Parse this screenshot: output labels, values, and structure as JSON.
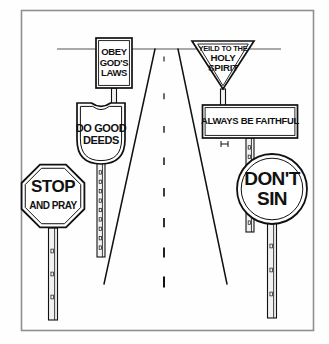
{
  "illustration": {
    "title": "Road with religious traffic signs",
    "background_color": "#fefefe",
    "ink_color": "#111111",
    "frame_color": "#8f8f8f",
    "frame": {
      "x": 21,
      "y": 10,
      "width": 292,
      "height": 320
    },
    "horizon": {
      "y": 49,
      "x_start": 57,
      "x_end": 281
    },
    "road": {
      "vanishing_x": 164,
      "top_y": 49,
      "left_top_x": 155,
      "right_top_x": 178,
      "left_bottom_x": 104,
      "right_bottom_x": 227,
      "bottom_y": 284,
      "center_dash_count": 8
    },
    "signs": [
      {
        "name": "obey-gods-laws-sign",
        "shape": "rectangle-vertical",
        "lines": [
          "OBEY",
          "GOD'S",
          "LAWS"
        ],
        "center_x": 114,
        "top_y": 38,
        "width": 36,
        "height": 50,
        "font_size": 9.5
      },
      {
        "name": "do-good-deeds-sign",
        "shape": "shield",
        "lines": [
          "DO GOOD",
          "DEEDS"
        ],
        "center_x": 101,
        "top_y": 103,
        "width": 48,
        "height": 61,
        "font_size": 11
      },
      {
        "name": "stop-and-pray-sign",
        "shape": "octagon",
        "lines": [
          "STOP",
          "AND PRAY"
        ],
        "center_x": 53,
        "center_y": 196,
        "radius": 34,
        "font_size": 17,
        "font_size_secondary": 10
      },
      {
        "name": "yeild-to-the-holy-spirit-sign",
        "shape": "triangle-down",
        "lines": [
          "YEILD TO THE",
          "HOLY",
          "SPIRIT"
        ],
        "center_x": 223,
        "top_y": 41,
        "width": 62,
        "height": 48,
        "font_size": 7.5
      },
      {
        "name": "always-be-faithful-sign",
        "shape": "rectangle-horizontal",
        "lines": [
          "ALWAYS BE FAITHFUL"
        ],
        "center_x": 250,
        "top_y": 105,
        "width": 95,
        "height": 33,
        "font_size": 9.5
      },
      {
        "name": "dont-sin-sign",
        "shape": "circle",
        "lines": [
          "DON'T",
          "SIN"
        ],
        "center_x": 272,
        "center_y": 189,
        "radius": 35,
        "font_size": 19
      }
    ],
    "posts": [
      {
        "name": "post-stop-and-pray",
        "x": 53,
        "top_y": 228,
        "bottom_y": 320,
        "width": 9,
        "holes": 3
      },
      {
        "name": "post-do-good-deeds",
        "x": 101,
        "top_y": 163,
        "bottom_y": 257,
        "width": 8,
        "holes": 9
      },
      {
        "name": "post-obey-gods-laws",
        "x": 114,
        "top_y": 88,
        "bottom_y": 104,
        "width": 5,
        "holes": 0
      },
      {
        "name": "post-yeild-holy-spirit",
        "x": 223,
        "top_y": 89,
        "bottom_y": 106,
        "width": 5,
        "holes": 0
      },
      {
        "name": "post-always-be-faithful",
        "x": 250,
        "top_y": 138,
        "bottom_y": 232,
        "width": 8,
        "holes": 9
      },
      {
        "name": "post-dont-sin",
        "x": 272,
        "top_y": 222,
        "bottom_y": 318,
        "width": 9,
        "holes": 3
      }
    ],
    "brackets": [
      {
        "name": "bracket-always-be-faithful",
        "x": 221,
        "y": 141,
        "width": 7,
        "height": 6
      }
    ]
  }
}
